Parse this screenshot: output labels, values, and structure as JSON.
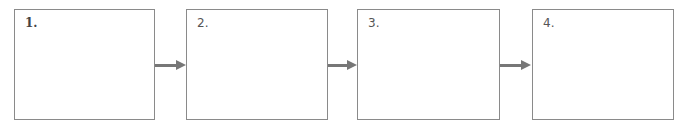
{
  "diagram": {
    "type": "process-flow",
    "steps": [
      {
        "label": "1."
      },
      {
        "label": "2."
      },
      {
        "label": "3."
      },
      {
        "label": "4."
      }
    ],
    "connector_color": "#777777",
    "border_color": "#8a8a8a"
  }
}
